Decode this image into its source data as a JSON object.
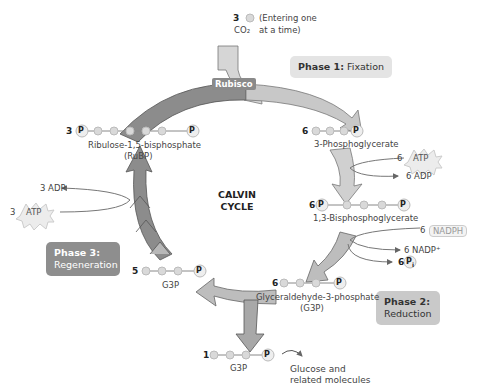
{
  "diagram": {
    "title": "CALVIN CYCLE",
    "title_lines": [
      "CALVIN",
      "CYCLE"
    ],
    "enzyme_label": "Rubisco",
    "co2_input": {
      "count": "3",
      "label": "CO₂",
      "note_line1": "(Entering one",
      "note_line2": "at a time)"
    },
    "phases": {
      "phase1": {
        "title": "Phase 1:",
        "name": "Fixation"
      },
      "phase2": {
        "title": "Phase 2:",
        "name": "Reduction"
      },
      "phase3": {
        "title": "Phase 3:",
        "name": "Regeneration"
      }
    },
    "molecules": {
      "rubp": {
        "count": "3",
        "name": "Ribulose-1,5-bisphosphate",
        "abbr": "(RuBP)"
      },
      "pga": {
        "count": "6",
        "name": "3-Phosphoglycerate"
      },
      "bpg": {
        "count": "6",
        "name": "1,3-Bisphosphoglycerate"
      },
      "g3p6": {
        "count": "6",
        "name": "Glyceraldehyde-3-phosphate",
        "abbr": "(G3P)"
      },
      "g3p5": {
        "count": "5",
        "name": "G3P"
      },
      "g3p1": {
        "count": "1",
        "name": "G3P"
      }
    },
    "inputs_outputs": {
      "atp6": {
        "count": "6",
        "label": "ATP"
      },
      "adp6": {
        "label": "6 ADP"
      },
      "nadph6": {
        "count": "6",
        "label": "NADPH"
      },
      "nadp6": {
        "label": "6 NADP⁺"
      },
      "pi6": {
        "count": "6",
        "label": "P",
        "sub": "i"
      },
      "atp3": {
        "count": "3",
        "label": "ATP"
      },
      "adp3": {
        "label": "3 ADP"
      }
    },
    "output": {
      "line1": "Glucose and",
      "line2": "related molecules"
    },
    "phosphate_symbol": "P",
    "colors": {
      "phase1_box": "#e4e4e4",
      "phase2_box": "#c9c9c9",
      "phase3_box": "#8e8e8e",
      "dark_arrow": "#8a8a8a",
      "light_arrow": "#c8c8c8"
    }
  }
}
